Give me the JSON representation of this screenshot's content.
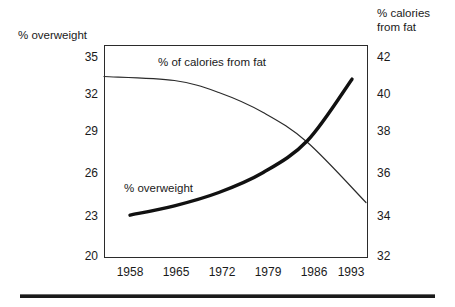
{
  "chart_data": {
    "type": "line",
    "title": "",
    "xlabel": "",
    "grid": false,
    "legend_position": "inline-annotations",
    "x": [
      1958,
      1965,
      1972,
      1979,
      1986,
      1993
    ],
    "categories": [
      "1958",
      "1965",
      "1972",
      "1979",
      "1986",
      "1993"
    ],
    "xtick_labels": [
      "1958",
      "1965",
      "1972",
      "1979",
      "1986",
      "1993"
    ],
    "xlim": [
      1958,
      1993
    ],
    "axes": {
      "left": {
        "label": "% overweight",
        "ticks": [
          35,
          32,
          29,
          26,
          23,
          20
        ],
        "tick_labels": [
          "35",
          "32",
          "29",
          "26",
          "23",
          "20"
        ],
        "limits": [
          20,
          35
        ]
      },
      "right": {
        "label": "% calories\nfrom fat",
        "ticks": [
          42,
          40,
          38,
          36,
          34,
          32
        ],
        "tick_labels": [
          "42",
          "40",
          "38",
          "36",
          "34",
          "32"
        ],
        "limits": [
          32,
          42
        ]
      }
    },
    "series": [
      {
        "name": "% of calories from fat",
        "axis": "right",
        "style": "thin-line",
        "annotation": "% of calories from fat",
        "x": [
          1958,
          1965,
          1972,
          1979,
          1986,
          1993
        ],
        "values": [
          41.0,
          40.8,
          40.2,
          39.2,
          37.7,
          34.7
        ]
      },
      {
        "name": "% overweight",
        "axis": "left",
        "style": "bold-line",
        "annotation": "% overweight",
        "x": [
          1958,
          1965,
          1972,
          1979,
          1986,
          1993
        ],
        "values": [
          23.1,
          23.8,
          24.8,
          26.3,
          28.7,
          33.3
        ]
      }
    ],
    "colors": {
      "frame": "#2b2b2b",
      "text": "#1a1a1a",
      "calories_line": "#2b2b2b",
      "overweight_line": "#111111",
      "background": "#ffffff",
      "rule": "#1a1a1a"
    },
    "notes": {
      "crossing_point_year_approx": 1988
    }
  }
}
